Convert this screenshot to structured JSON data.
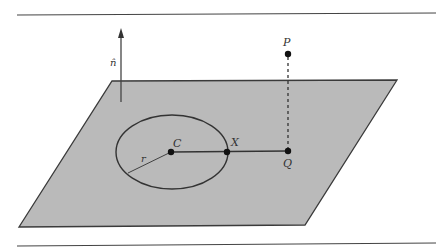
{
  "diagram": {
    "colors": {
      "plane_fill": "#b9b9b9",
      "stroke": "#3a3a3a",
      "background": "#ffffff"
    },
    "plane": {
      "corners": [
        [
          112,
          81
        ],
        [
          397,
          80
        ],
        [
          305,
          225
        ],
        [
          19,
          227
        ]
      ]
    },
    "normal_vector": {
      "label": "n̂",
      "from": [
        120,
        102
      ],
      "to": [
        120,
        27
      ]
    },
    "circle": {
      "center": [
        172,
        152
      ],
      "rx": 56,
      "ry": 37
    },
    "points": {
      "C": {
        "label": "C",
        "pos": [
          171,
          152
        ]
      },
      "X": {
        "label": "X",
        "pos": [
          227,
          152
        ]
      },
      "Q": {
        "label": "Q",
        "pos": [
          288,
          151
        ]
      },
      "P": {
        "label": "P",
        "pos": [
          288,
          54
        ]
      }
    },
    "radius_label": "r",
    "rules": {
      "top_y": 14,
      "bottom_y": 244
    }
  }
}
